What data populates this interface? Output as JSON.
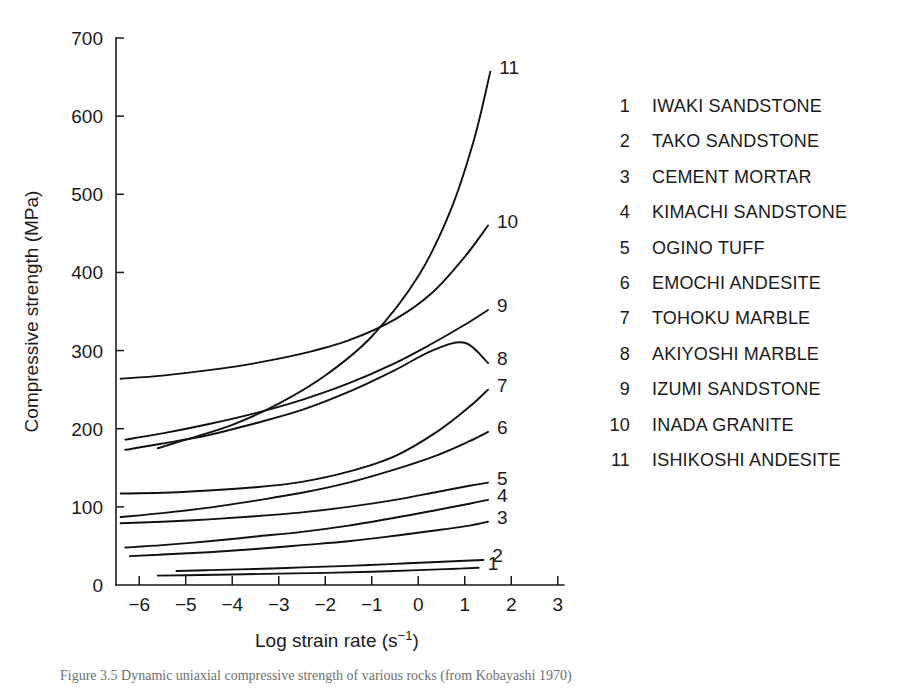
{
  "chart_data": {
    "type": "line",
    "title": "",
    "xlabel": "Log strain rate (s⁻¹)",
    "ylabel": "Compressive strength (MPa)",
    "xlim": [
      -6.5,
      3
    ],
    "ylim": [
      0,
      700
    ],
    "xticks": [
      -6,
      -5,
      -4,
      -3,
      -2,
      -1,
      0,
      1,
      2,
      3
    ],
    "xtick_labels": [
      "−6",
      "−5",
      "−4",
      "−3",
      "−2",
      "−1",
      "0",
      "1",
      "2",
      "3"
    ],
    "yticks": [
      0,
      100,
      200,
      300,
      400,
      500,
      600,
      700
    ],
    "ytick_labels": [
      "0",
      "100",
      "200",
      "300",
      "400",
      "500",
      "600",
      "700"
    ],
    "grid": false,
    "legend_position": "right-outside",
    "series": [
      {
        "name": "IWAKI SANDSTONE",
        "label": "1",
        "x": [
          -5.6,
          -5.0,
          -4.0,
          -3.0,
          -2.0,
          -1.0,
          0.0,
          0.7,
          1.3
        ],
        "y": [
          12,
          12.5,
          13.5,
          14.5,
          15.5,
          17,
          19,
          20.5,
          22
        ]
      },
      {
        "name": "TAKO SANDSTONE",
        "label": "2",
        "x": [
          -5.2,
          -4.5,
          -3.5,
          -2.5,
          -1.5,
          -0.5,
          0.4,
          1.0,
          1.4
        ],
        "y": [
          18,
          19,
          20.5,
          22.5,
          24.5,
          27,
          29.5,
          31,
          32
        ]
      },
      {
        "name": "CEMENT MORTAR",
        "label": "3",
        "x": [
          -6.2,
          -5.5,
          -4.5,
          -3.5,
          -2.5,
          -1.5,
          -0.5,
          0.4,
          1.1,
          1.5
        ],
        "y": [
          37,
          39,
          42,
          46,
          51,
          56,
          63,
          70,
          76,
          81
        ]
      },
      {
        "name": "KIMACHI SANDSTONE",
        "label": "4",
        "x": [
          -6.3,
          -5.5,
          -4.5,
          -3.5,
          -2.5,
          -1.5,
          -0.5,
          0.4,
          1.1,
          1.5
        ],
        "y": [
          48,
          51,
          56,
          62,
          68,
          76,
          86,
          96,
          104,
          109
        ]
      },
      {
        "name": "OGINO TUFF",
        "label": "5",
        "x": [
          -6.4,
          -5.5,
          -4.5,
          -3.5,
          -2.5,
          -1.5,
          -0.5,
          0.4,
          1.1,
          1.5
        ],
        "y": [
          79,
          81,
          84,
          88,
          93,
          100,
          109,
          119,
          127,
          131
        ]
      },
      {
        "name": "EMOCHI ANDESITE",
        "label": "6",
        "x": [
          -6.4,
          -5.5,
          -4.5,
          -3.5,
          -2.5,
          -1.5,
          -0.5,
          0.4,
          1.1,
          1.5
        ],
        "y": [
          87,
          92,
          99,
          108,
          118,
          131,
          148,
          166,
          184,
          196
        ]
      },
      {
        "name": "TOHOKU MARBLE",
        "label": "7",
        "x": [
          -6.4,
          -5.5,
          -4.5,
          -3.5,
          -2.5,
          -1.5,
          -0.5,
          0.4,
          1.1,
          1.5
        ],
        "y": [
          117,
          118,
          121,
          125,
          132,
          145,
          165,
          196,
          228,
          250
        ]
      },
      {
        "name": "AKIYOSHI MARBLE",
        "label": "8",
        "x": [
          -6.3,
          -5.5,
          -4.5,
          -3.5,
          -2.5,
          -1.5,
          -0.5,
          0.3,
          1.0,
          1.5
        ],
        "y": [
          173,
          181,
          192,
          207,
          224,
          247,
          275,
          300,
          310,
          284
        ]
      },
      {
        "name": "IZUMI SANDSTONE",
        "label": "9",
        "x": [
          -6.3,
          -5.5,
          -4.5,
          -3.5,
          -2.5,
          -1.5,
          -0.5,
          0.3,
          1.0,
          1.5
        ],
        "y": [
          186,
          194,
          206,
          220,
          237,
          258,
          284,
          309,
          333,
          352
        ]
      },
      {
        "name": "INADA GRANITE",
        "label": "10",
        "x": [
          -6.4,
          -5.5,
          -4.5,
          -3.5,
          -2.5,
          -1.5,
          -0.5,
          0.3,
          1.0,
          1.5
        ],
        "y": [
          264,
          268,
          275,
          284,
          296,
          313,
          340,
          374,
          420,
          460
        ]
      },
      {
        "name": "ISHIKOSHI ANDESITE",
        "label": "11",
        "x": [
          -5.6,
          -5.0,
          -4.0,
          -3.0,
          -2.0,
          -1.0,
          0.0,
          0.7,
          1.2,
          1.55
        ],
        "y": [
          175,
          186,
          205,
          232,
          268,
          318,
          395,
          480,
          570,
          657
        ]
      }
    ]
  },
  "legend": {
    "items": [
      {
        "num": "1",
        "name": "IWAKI SANDSTONE"
      },
      {
        "num": "2",
        "name": "TAKO SANDSTONE"
      },
      {
        "num": "3",
        "name": "CEMENT MORTAR"
      },
      {
        "num": "4",
        "name": "KIMACHI SANDSTONE"
      },
      {
        "num": "5",
        "name": "OGINO TUFF"
      },
      {
        "num": "6",
        "name": "EMOCHI ANDESITE"
      },
      {
        "num": "7",
        "name": "TOHOKU MARBLE"
      },
      {
        "num": "8",
        "name": "AKIYOSHI MARBLE"
      },
      {
        "num": "9",
        "name": "IZUMI SANDSTONE"
      },
      {
        "num": "10",
        "name": "INADA GRANITE"
      },
      {
        "num": "11",
        "name": "ISHIKOSHI ANDESITE"
      }
    ]
  },
  "caption": {
    "text": "Figure 3.5  Dynamic uniaxial compressive strength of various rocks (from Kobayashi 1970)"
  }
}
